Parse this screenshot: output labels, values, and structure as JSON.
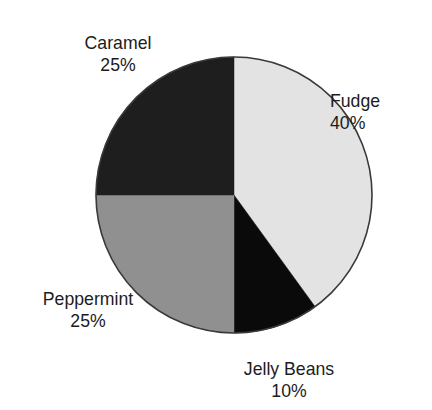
{
  "chart_data": {
    "type": "pie",
    "title": "",
    "title_visibility": "cropped-off-top-edge",
    "categories": [
      "Fudge",
      "Jelly Beans",
      "Peppermint",
      "Caramel"
    ],
    "values": [
      40,
      10,
      25,
      25
    ],
    "value_unit": "%",
    "value_labels": [
      "40%",
      "10%",
      "25%",
      "25%"
    ],
    "start_angle_deg": 0,
    "direction": "clockwise",
    "legend": "none",
    "grid": false,
    "slices": [
      {
        "label": "Fudge",
        "value": 40,
        "value_label": "40%",
        "color": "#e3e3e3",
        "start_deg": 0,
        "end_deg": 144
      },
      {
        "label": "Jelly Beans",
        "value": 10,
        "value_label": "10%",
        "color": "#0a0a0a",
        "start_deg": 144,
        "end_deg": 180
      },
      {
        "label": "Peppermint",
        "value": 25,
        "value_label": "25%",
        "color": "#909090",
        "start_deg": 180,
        "end_deg": 270
      },
      {
        "label": "Caramel",
        "value": 25,
        "value_label": "25%",
        "color": "#1e1e1e",
        "start_deg": 270,
        "end_deg": 360
      }
    ],
    "outline_color": "#3a3a3a",
    "background_color": "#ffffff",
    "text_color": "#1c1c1c"
  },
  "labels": {
    "caramel": {
      "name": "Caramel",
      "value": "25%"
    },
    "fudge": {
      "name": "Fudge",
      "value": "40%"
    },
    "peppermint": {
      "name": "Peppermint",
      "value": "25%"
    },
    "jelly_beans": {
      "name": "Jelly Beans",
      "value": "10%"
    }
  }
}
